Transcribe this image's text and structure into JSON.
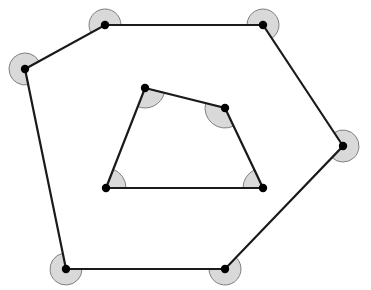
{
  "canvas": {
    "width": 371,
    "height": 290,
    "background": "#ffffff",
    "title": "Nested polygon angle diagram"
  },
  "style": {
    "sector_fill": "#d9d9d9",
    "sector_stroke": "#7f7f7f",
    "sector_stroke_width": 1,
    "edge_stroke": "#1a1a1a",
    "edge_stroke_width": 2.2,
    "vertex_fill": "#000000",
    "vertex_radius": 4.2
  },
  "shapes": {
    "outer_polygon": {
      "name": "outer-hexagon",
      "sides": 6,
      "closed": true,
      "sector_radius": 16,
      "points": [
        {
          "label": "A",
          "x": 25,
          "y": 69
        },
        {
          "label": "B",
          "x": 105,
          "y": 25
        },
        {
          "label": "C",
          "x": 263,
          "y": 25
        },
        {
          "label": "D",
          "x": 343,
          "y": 146
        },
        {
          "label": "E",
          "x": 225,
          "y": 269
        },
        {
          "label": "F",
          "x": 66,
          "y": 269
        }
      ]
    },
    "inner_polygon": {
      "name": "inner-quadrilateral",
      "sides": 4,
      "closed": true,
      "sector_radius": 20,
      "sector_reflex": true,
      "points": [
        {
          "label": "P",
          "x": 145,
          "y": 88
        },
        {
          "label": "Q",
          "x": 225,
          "y": 108
        },
        {
          "label": "R",
          "x": 263,
          "y": 188
        },
        {
          "label": "S",
          "x": 106,
          "y": 188
        }
      ]
    }
  }
}
